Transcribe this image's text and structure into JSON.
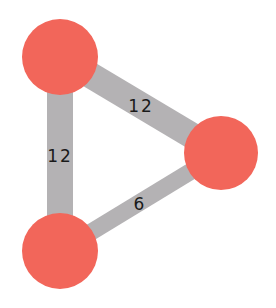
{
  "diagram": {
    "type": "weighted-undirected-graph",
    "colors": {
      "background": "#ffffff",
      "node_fill": "#f2665a",
      "edge_stroke": "#b4b2b4",
      "label_text": "#1a1a1a"
    },
    "nodes": [
      {
        "id": "A",
        "position": "top-left",
        "cx": 60,
        "cy": 57,
        "r": 38
      },
      {
        "id": "B",
        "position": "right",
        "cx": 221,
        "cy": 153,
        "r": 37
      },
      {
        "id": "C",
        "position": "bottom-left",
        "cx": 60,
        "cy": 251,
        "r": 38
      }
    ],
    "edges": [
      {
        "from": "A",
        "to": "B",
        "weight": "12",
        "width": 26,
        "label_x": 141,
        "label_y": 112
      },
      {
        "from": "A",
        "to": "C",
        "weight": "12",
        "width": 26,
        "label_x": 60,
        "label_y": 162
      },
      {
        "from": "B",
        "to": "C",
        "weight": "6",
        "width": 17,
        "label_x": 140,
        "label_y": 210
      }
    ]
  }
}
